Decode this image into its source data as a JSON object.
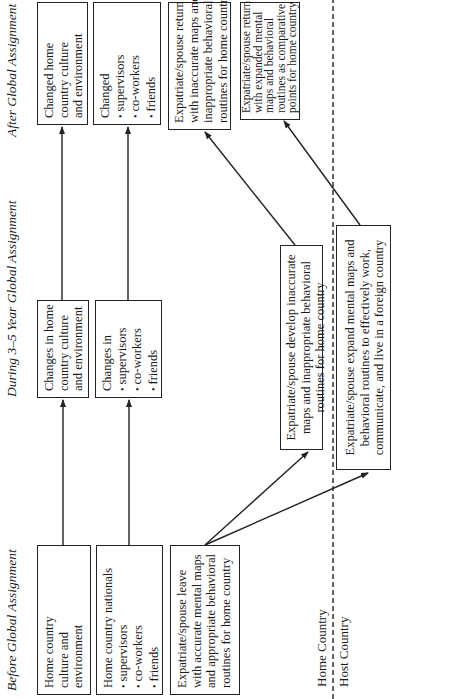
{
  "columns": {
    "before": "Before Global Assignment",
    "during": "During 3–5 Year Global Assignment",
    "after": "After Global Assignment"
  },
  "before": {
    "culture_box": {
      "lines": [
        "Home country",
        "culture and",
        "environment"
      ]
    },
    "nationals_box": {
      "title": "Home country nationals",
      "items": [
        "supervisors",
        "co-workers",
        "friends"
      ]
    },
    "leave_box": {
      "lines": [
        "Expatriate/spouse leave",
        "with accurate mental maps",
        "and appropriate behavioral",
        "routines for home country"
      ]
    }
  },
  "during": {
    "culture_box": {
      "lines": [
        "Changes in home",
        "country culture",
        "and environment"
      ]
    },
    "changes_box": {
      "title": "Changes in",
      "items": [
        "supervisors",
        "co-workers",
        "friends"
      ]
    },
    "develop_box": {
      "lines": [
        "Expatriate/spouse develop inaccurate",
        "maps and inappropriate behavioral",
        "routines for home country"
      ]
    },
    "expand_box": {
      "lines": [
        "Expatriate/spouse expand mental maps and",
        "behavioral routines to effectively work,",
        "communicate, and live in a foreign country"
      ]
    }
  },
  "after": {
    "culture_box": {
      "lines": [
        "Changed home",
        "country culture",
        "and environment"
      ]
    },
    "changed_box": {
      "title": "Changed",
      "items": [
        "supervisors",
        "co-workers",
        "friends"
      ]
    },
    "return_inaccurate_box": {
      "lines": [
        "Expatriate/spouse return",
        "with inaccurate maps and",
        "inappropriate behavioral",
        "routines for home country"
      ]
    },
    "return_expanded_box": {
      "lines": [
        "Expatriate/spouse return",
        "with expanded mental",
        "maps and behavioral",
        "routines as comparative",
        "points for home country"
      ]
    }
  },
  "divider": {
    "home_label": "Home Country",
    "host_label": "Host Country"
  },
  "colors": {
    "line": "#222222",
    "text": "#1a1a1a",
    "background": "#ffffff"
  }
}
